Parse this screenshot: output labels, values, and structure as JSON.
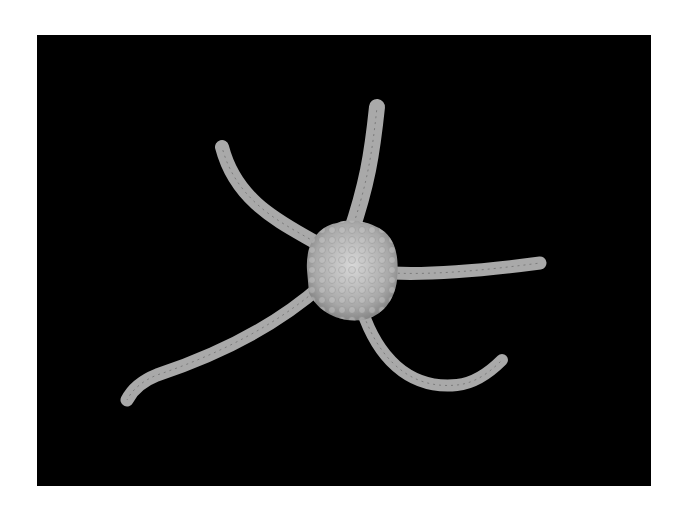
{
  "image": {
    "subject": "brittle star",
    "background_color": "#000000",
    "border_color": "#ffffff",
    "body_color": "#b8b8b8"
  }
}
